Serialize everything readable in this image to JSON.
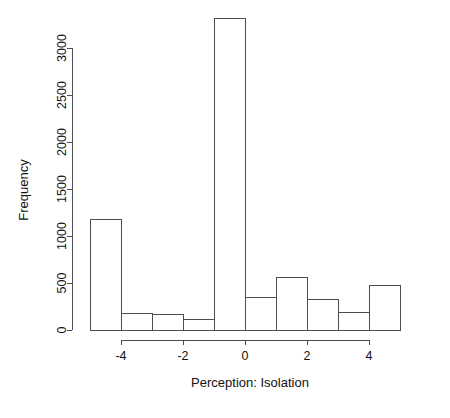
{
  "chart_data": {
    "type": "bar",
    "subtype": "histogram",
    "title": "",
    "xlabel": "Perception: Isolation",
    "ylabel": "Frequency",
    "xlim": [
      -5,
      5
    ],
    "ylim": [
      0,
      3300
    ],
    "grid": false,
    "legend": null,
    "bin_width": 1,
    "bin_edges": [
      -5,
      -4,
      -3,
      -2,
      -1,
      0,
      1,
      2,
      3,
      4,
      5
    ],
    "categories": [
      "-5 to -4",
      "-4 to -3",
      "-3 to -2",
      "-2 to -1",
      "-1 to 0",
      "0 to 1",
      "1 to 2",
      "2 to 3",
      "3 to 4",
      "4 to 5"
    ],
    "values": [
      1175,
      180,
      160,
      115,
      3310,
      350,
      560,
      325,
      190,
      470
    ],
    "x_ticks": [
      -4,
      -2,
      0,
      2,
      4
    ],
    "x_tick_labels": [
      "-4",
      "-2",
      "0",
      "2",
      "4"
    ],
    "y_ticks": [
      0,
      500,
      1000,
      1500,
      2000,
      2500,
      3000
    ],
    "y_tick_labels": [
      "0",
      "500",
      "1000",
      "1500",
      "2000",
      "2500",
      "3000"
    ],
    "bar_fill": "#ffffff",
    "bar_stroke": "#4d4d4d",
    "background": "#ffffff"
  }
}
